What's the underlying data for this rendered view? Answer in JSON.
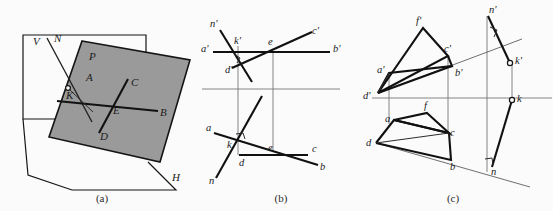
{
  "figure": {
    "background_color": "#fbfbfb",
    "ink_color": "#1a1a1a",
    "plane_fill_color": "#9a9a9a",
    "panels": [
      {
        "id": "a",
        "caption": "(a)",
        "caption_x": 102,
        "caption_y": 199
      },
      {
        "id": "b",
        "caption": "(b)",
        "caption_x": 281,
        "caption_y": 199
      },
      {
        "id": "c",
        "caption": "(c)",
        "caption_x": 453,
        "caption_y": 199
      }
    ]
  },
  "panel_a": {
    "caption": "(a)",
    "labels": [
      {
        "text": "V",
        "x": 33,
        "y": 45
      },
      {
        "text": "N",
        "x": 54,
        "y": 42
      },
      {
        "text": "P",
        "x": 89,
        "y": 60
      },
      {
        "text": "A",
        "x": 86,
        "y": 81
      },
      {
        "text": "K",
        "x": 70,
        "y": 96
      },
      {
        "text": "C",
        "x": 131,
        "y": 86
      },
      {
        "text": "E",
        "x": 113,
        "y": 114
      },
      {
        "text": "B",
        "x": 160,
        "y": 116
      },
      {
        "text": "D",
        "x": 102,
        "y": 137
      },
      {
        "text": "H",
        "x": 174,
        "y": 180
      }
    ],
    "plane_P_outline": "82,41 190,60 160,162 49,137",
    "vertical_plane_outline": "23,35 146,35 146,119 23,119",
    "horizontal_plane_outline": "23,119 28,175 72,190 176,190 148,162",
    "normal_line": {
      "x1": 47,
      "y1": 38,
      "x2": 92,
      "y2": 122
    },
    "point_K": {
      "x": 73,
      "y": 88
    },
    "line_AB": {
      "x1": 57,
      "y1": 101,
      "x2": 158,
      "y2": 111
    },
    "line_CD": {
      "x1": 128,
      "y1": 79,
      "x2": 99,
      "y2": 133
    },
    "intersection_E": {
      "x": 114,
      "y": 106
    }
  },
  "panel_b": {
    "caption": "(b)",
    "ground_line": {
      "x1": 202,
      "y1": 89,
      "x2": 340,
      "y2": 89
    },
    "labels": [
      {
        "text": "n'",
        "x": 212,
        "y": 26
      },
      {
        "text": "k'",
        "x": 245,
        "y": 42
      },
      {
        "text": "e",
        "x": 280,
        "y": 43
      },
      {
        "text": "c'",
        "x": 312,
        "y": 33
      },
      {
        "text": "a'",
        "x": 205,
        "y": 50
      },
      {
        "text": "b'",
        "x": 332,
        "y": 49
      },
      {
        "text": "d'",
        "x": 228,
        "y": 72
      },
      {
        "text": "a",
        "x": 217,
        "y": 132
      },
      {
        "text": "k",
        "x": 233,
        "y": 145
      },
      {
        "text": "d",
        "x": 240,
        "y": 160
      },
      {
        "text": "e",
        "x": 278,
        "y": 147
      },
      {
        "text": "c",
        "x": 311,
        "y": 146
      },
      {
        "text": "b",
        "x": 320,
        "y": 168
      },
      {
        "text": "n",
        "x": 213,
        "y": 182
      }
    ],
    "top_line_ab": {
      "x1": 213,
      "y1": 52,
      "x2": 330,
      "y2": 52
    },
    "top_line_dc": {
      "x1": 232,
      "y1": 68,
      "x2": 310,
      "y2": 36
    },
    "top_line_n": {
      "x1": 220,
      "y1": 30,
      "x2": 252,
      "y2": 82
    },
    "bottom_line_ab": {
      "x1": 214,
      "y1": 133,
      "x2": 318,
      "y2": 165
    },
    "bottom_line_dc": {
      "x1": 239,
      "y1": 155,
      "x2": 308,
      "y2": 155
    },
    "bottom_line_n": {
      "x1": 216,
      "y1": 178,
      "x2": 260,
      "y2": 98
    },
    "vertical_k": {
      "x1": 238,
      "y1": 46,
      "x2": 238,
      "y2": 155
    },
    "vertical_e": {
      "x1": 273,
      "y1": 52,
      "x2": 273,
      "y2": 150
    },
    "right_angle_top": {
      "x": 236,
      "y": 56
    },
    "right_angle_bottom": {
      "x": 240,
      "y": 134
    }
  },
  "panel_c": {
    "caption": "(c)",
    "ground_line": {
      "x1": 372,
      "y1": 98,
      "x2": 552,
      "y2": 98
    },
    "labels": [
      {
        "text": "f'",
        "x": 417,
        "y": 22
      },
      {
        "text": "c'",
        "x": 444,
        "y": 50
      },
      {
        "text": "a'",
        "x": 382,
        "y": 70
      },
      {
        "text": "b'",
        "x": 466,
        "y": 73
      },
      {
        "text": "d'",
        "x": 367,
        "y": 99
      },
      {
        "text": "n'",
        "x": 493,
        "y": 12
      },
      {
        "text": "k'",
        "x": 516,
        "y": 60
      },
      {
        "text": "k",
        "x": 517,
        "y": 104
      },
      {
        "text": "f",
        "x": 422,
        "y": 109
      },
      {
        "text": "a",
        "x": 393,
        "y": 127
      },
      {
        "text": "c",
        "x": 443,
        "y": 139
      },
      {
        "text": "d",
        "x": 369,
        "y": 140
      },
      {
        "text": "b",
        "x": 455,
        "y": 168
      },
      {
        "text": "n",
        "x": 496,
        "y": 175
      }
    ],
    "top_triangle": "423,28 448,56 378,93",
    "top_quad": "378,93 389,73 452,66 448,56",
    "bottom_triangle": "427,113 449,133 376,143",
    "bottom_quad": "376,143 394,120 448,133 451,160",
    "normal_upper": {
      "x1": 488,
      "y1": 16,
      "x2": 510,
      "y2": 63
    },
    "normal_lower": {
      "x1": 512,
      "y1": 100,
      "x2": 492,
      "y2": 166
    },
    "oblique_line": {
      "x1": 378,
      "y1": 93,
      "x2": 520,
      "y2": 40
    },
    "oblique_line_lower": {
      "x1": 376,
      "y1": 143,
      "x2": 528,
      "y2": 186
    },
    "vertical_k_line": {
      "x1": 512,
      "y1": 63,
      "x2": 512,
      "y2": 100
    },
    "vertical_n_line": {
      "x1": 487,
      "y1": 16,
      "x2": 487,
      "y2": 172
    },
    "vertical_a_line": {
      "x1": 389,
      "y1": 73,
      "x2": 389,
      "y2": 122
    },
    "vertical_c_line": {
      "x1": 448,
      "y1": 56,
      "x2": 448,
      "y2": 133
    },
    "point_k_prime": {
      "x": 510,
      "y": 63
    },
    "point_k": {
      "x": 512,
      "y": 100
    },
    "right_angle_upper": {
      "x": 493,
      "y": 31
    },
    "right_angle_lower": {
      "x": 489,
      "y": 163
    }
  }
}
